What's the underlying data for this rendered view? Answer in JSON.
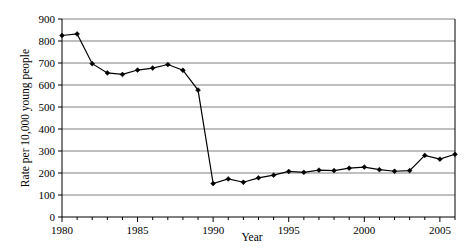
{
  "chart_data": {
    "type": "line",
    "title": "",
    "xlabel": "Year",
    "ylabel": "Rate per 10,000 young people",
    "xlim": [
      1980,
      2006
    ],
    "ylim": [
      0,
      900
    ],
    "grid": true,
    "legend": "none",
    "x_tick_labels": [
      "1980",
      "1985",
      "1990",
      "1995",
      "2000",
      "2005"
    ],
    "x_tick_values": [
      1980,
      1985,
      1990,
      1995,
      2000,
      2005
    ],
    "x_minor_ticks": [
      1980,
      1981,
      1982,
      1983,
      1984,
      1985,
      1986,
      1987,
      1988,
      1989,
      1990,
      1991,
      1992,
      1993,
      1994,
      1995,
      1996,
      1997,
      1998,
      1999,
      2000,
      2001,
      2002,
      2003,
      2004,
      2005,
      2006
    ],
    "y_tick_labels": [
      "0",
      "100",
      "200",
      "300",
      "400",
      "500",
      "600",
      "700",
      "800",
      "900"
    ],
    "y_tick_values": [
      0,
      100,
      200,
      300,
      400,
      500,
      600,
      700,
      800,
      900
    ],
    "series": [
      {
        "name": "Rate per 10,000 young people",
        "marker": "diamond",
        "color": "#000000",
        "x": [
          1980,
          1981,
          1982,
          1983,
          1984,
          1985,
          1986,
          1987,
          1988,
          1989,
          1990,
          1991,
          1992,
          1993,
          1994,
          1995,
          1996,
          1997,
          1998,
          1999,
          2000,
          2001,
          2002,
          2003,
          2004,
          2005,
          2006
        ],
        "values": [
          825,
          832,
          697,
          655,
          648,
          668,
          677,
          693,
          667,
          577,
          152,
          173,
          158,
          178,
          190,
          207,
          203,
          213,
          211,
          222,
          227,
          215,
          208,
          211,
          280,
          263,
          285
        ]
      }
    ]
  }
}
